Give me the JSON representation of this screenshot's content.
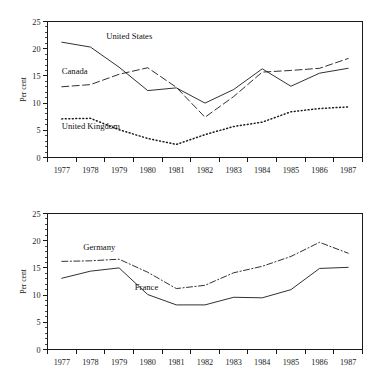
{
  "figure": {
    "background": "#ffffff",
    "ink": "#1a1a1a"
  },
  "chart_data": [
    {
      "id": "top",
      "type": "line",
      "title": "",
      "xlabel": "",
      "ylabel": "Per cent",
      "x": [
        1977,
        1978,
        1979,
        1980,
        1981,
        1982,
        1983,
        1984,
        1985,
        1986,
        1987
      ],
      "xtick_labels": [
        "1977",
        "1978",
        "1979",
        "1980",
        "1981",
        "1982",
        "1983",
        "1984",
        "1985",
        "1986",
        "1987"
      ],
      "ytick_labels": [
        "0",
        "5",
        "10",
        "15",
        "20",
        "25"
      ],
      "ytick_values": [
        0,
        5,
        10,
        15,
        20,
        25
      ],
      "ylim": [
        0,
        25
      ],
      "y_minor_step": 1,
      "grid": false,
      "legend_position": "inline-annotations",
      "series": [
        {
          "name": "United States",
          "style": "solid",
          "label_x": 1978.55,
          "label_y": 21.7,
          "values": [
            21.2,
            20.3,
            16.6,
            12.3,
            12.8,
            10.0,
            12.5,
            16.3,
            13.1,
            15.5,
            16.4
          ]
        },
        {
          "name": "Canada",
          "style": "dashed",
          "label_x": 1977.0,
          "label_y": 15.4,
          "values": [
            13.0,
            13.4,
            15.3,
            16.5,
            12.9,
            7.4,
            11.2,
            15.7,
            16.0,
            16.4,
            18.2
          ]
        },
        {
          "name": "United Kingdom",
          "style": "dotted",
          "label_x": 1977.0,
          "label_y": 5.3,
          "values": [
            7.1,
            7.2,
            5.1,
            3.5,
            2.4,
            4.2,
            5.7,
            6.5,
            8.4,
            9.0,
            9.3
          ]
        }
      ]
    },
    {
      "id": "bottom",
      "type": "line",
      "title": "",
      "xlabel": "",
      "ylabel": "Per cent",
      "x": [
        1977,
        1978,
        1979,
        1980,
        1981,
        1982,
        1983,
        1984,
        1985,
        1986,
        1987
      ],
      "xtick_labels": [
        "1977",
        "1978",
        "1979",
        "1980",
        "1981",
        "1982",
        "1983",
        "1984",
        "1985",
        "1986",
        "1987"
      ],
      "ytick_labels": [
        "0",
        "5",
        "10",
        "15",
        "20",
        "25"
      ],
      "ytick_values": [
        0,
        5,
        10,
        15,
        20,
        25
      ],
      "ylim": [
        0,
        25
      ],
      "y_minor_step": 1,
      "grid": false,
      "legend_position": "inline-annotations",
      "series": [
        {
          "name": "Germany",
          "style": "dashdot",
          "label_x": 1977.75,
          "label_y": 18.3,
          "values": [
            16.2,
            16.3,
            16.6,
            14.2,
            11.2,
            11.8,
            14.1,
            15.3,
            17.1,
            19.7,
            17.7
          ]
        },
        {
          "name": "France",
          "style": "solid",
          "label_x": 1979.55,
          "label_y": 11.0,
          "values": [
            13.1,
            14.4,
            15.0,
            10.1,
            8.2,
            8.2,
            9.6,
            9.5,
            11.0,
            14.9,
            15.1
          ]
        }
      ]
    }
  ]
}
